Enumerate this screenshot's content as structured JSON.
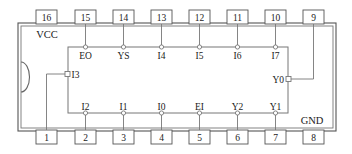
{
  "diagram": {
    "package": {
      "orientation_notch": "semicircle-notch",
      "power_label_top": "VCC",
      "ground_label_bottom": "GND",
      "outline_color": "#555555",
      "inner_box_color": "#777777",
      "text_color": "#1a1a1a",
      "background": "#ffffff"
    },
    "pins_top": [
      {
        "number": "16",
        "signal": "VCC",
        "connector": "none"
      },
      {
        "number": "15",
        "signal": "EO",
        "connector": "circle"
      },
      {
        "number": "14",
        "signal": "YS",
        "connector": "circle"
      },
      {
        "number": "13",
        "signal": "I4",
        "connector": "circle"
      },
      {
        "number": "12",
        "signal": "I5",
        "connector": "circle"
      },
      {
        "number": "11",
        "signal": "I6",
        "connector": "circle"
      },
      {
        "number": "10",
        "signal": "I7",
        "connector": "circle"
      },
      {
        "number": "9",
        "signal": "Y0",
        "connector": "square"
      }
    ],
    "pins_bottom": [
      {
        "number": "1",
        "signal": "I3",
        "connector": "square"
      },
      {
        "number": "2",
        "signal": "I2",
        "connector": "circle"
      },
      {
        "number": "3",
        "signal": "I1",
        "connector": "circle"
      },
      {
        "number": "4",
        "signal": "I0",
        "connector": "circle"
      },
      {
        "number": "5",
        "signal": "EI",
        "connector": "circle"
      },
      {
        "number": "6",
        "signal": "Y2",
        "connector": "circle"
      },
      {
        "number": "7",
        "signal": "Y1",
        "connector": "circle"
      },
      {
        "number": "8",
        "signal": "GND",
        "connector": "none"
      }
    ],
    "inner_labels_top": [
      "EO",
      "YS",
      "I4",
      "I5",
      "I6",
      "I7"
    ],
    "inner_labels_bottom": [
      "I2",
      "I1",
      "I0",
      "EI",
      "Y2",
      "Y1"
    ],
    "inner_label_left": "I3",
    "inner_label_right": "Y0"
  }
}
